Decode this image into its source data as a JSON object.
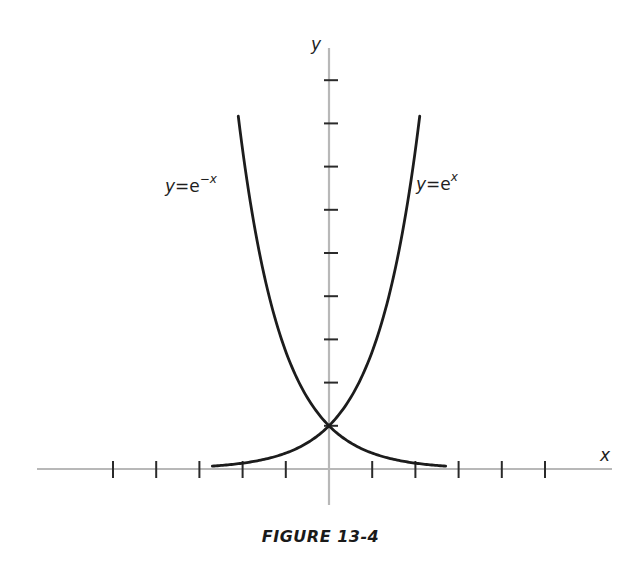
{
  "caption": "FIGURE 13-4",
  "chart_data": {
    "type": "line",
    "title": "FIGURE 13-4",
    "xlabel": "x",
    "ylabel": "y",
    "xlim": [
      -6.8,
      6.6
    ],
    "ylim": [
      -0.8,
      9.8
    ],
    "x_ticks": [
      -5,
      -4,
      -3,
      -2,
      -1,
      1,
      2,
      3,
      4,
      5
    ],
    "y_ticks": [
      1,
      2,
      3,
      4,
      5,
      6,
      7,
      8,
      9
    ],
    "tick_labels_shown": false,
    "grid": false,
    "series": [
      {
        "name": "y=e^x",
        "label": "y = e^x",
        "function": "exp(x)",
        "x": [
          -2.7,
          -2.5,
          -2,
          -1.5,
          -1,
          -0.5,
          0,
          0.5,
          1,
          1.5,
          2,
          2.1
        ],
        "values": [
          0.067,
          0.082,
          0.135,
          0.223,
          0.368,
          0.607,
          1,
          1.649,
          2.718,
          4.482,
          7.389,
          8.166
        ]
      },
      {
        "name": "y=e^-x",
        "label": "y = e^(-x)",
        "function": "exp(-x)",
        "x": [
          -2.1,
          -2,
          -1.5,
          -1,
          -0.5,
          0,
          0.5,
          1,
          1.5,
          2,
          2.5,
          2.7
        ],
        "values": [
          8.166,
          7.389,
          4.482,
          2.718,
          1.649,
          1,
          0.607,
          0.368,
          0.223,
          0.135,
          0.082,
          0.067
        ]
      }
    ],
    "annotations": [
      {
        "text": "y=e^-x",
        "near": "left curve, upper"
      },
      {
        "text": "y=e^x",
        "near": "right curve, upper"
      },
      {
        "text": "intersection at (0, 1)"
      }
    ]
  },
  "labels": {
    "x_axis": "x",
    "y_axis": "y",
    "left_curve_y": "y",
    "left_curve_eq": "=e",
    "left_curve_exp": "−x",
    "right_curve_y": "y",
    "right_curve_eq": "=e",
    "right_curve_exp": "x"
  }
}
